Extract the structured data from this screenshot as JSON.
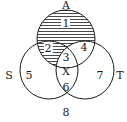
{
  "diagram": {
    "type": "venn",
    "sets": [
      {
        "name": "A",
        "label": "A"
      },
      {
        "name": "S",
        "label": "S"
      },
      {
        "name": "T",
        "label": "T"
      }
    ],
    "regions": [
      {
        "id": "1",
        "label": "1",
        "sets": [
          "A"
        ],
        "shaded": true
      },
      {
        "id": "2",
        "label": "2",
        "sets": [
          "A",
          "S"
        ],
        "shaded": true
      },
      {
        "id": "3",
        "label": "3",
        "sets": [
          "A",
          "S",
          "T"
        ],
        "shaded": false
      },
      {
        "id": "4",
        "label": "4",
        "sets": [
          "A",
          "T"
        ],
        "shaded": false
      },
      {
        "id": "5",
        "label": "5",
        "sets": [
          "S"
        ],
        "shaded": false
      },
      {
        "id": "6",
        "label": "6",
        "sets": [
          "S",
          "T"
        ],
        "shaded": false
      },
      {
        "id": "7",
        "label": "7",
        "sets": [
          "T"
        ],
        "shaded": false
      },
      {
        "id": "8",
        "label": "8",
        "sets": [],
        "shaded": false
      }
    ],
    "marker": {
      "label": "X",
      "region": "3"
    },
    "shading": "horizontal-lines",
    "colors": {
      "stroke": "#1a1a1a",
      "background": "#ffffff"
    }
  }
}
